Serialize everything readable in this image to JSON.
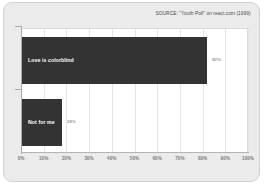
{
  "source_note": "SOURCE: \"Youth Poll\" on react.com (1999)",
  "colors": {
    "bar": "#333333",
    "plot_background": "#ffffff",
    "card_background": "#ebebeb",
    "gridline": "#e4e4e4",
    "axis": "#a9a9a9",
    "tick_label": "#7d7d7d",
    "value_label": "#5a5a5a",
    "bar_label": "#ffffff"
  },
  "chart_data": {
    "type": "bar",
    "orientation": "horizontal",
    "title": "",
    "subtitle": "",
    "xlabel": "",
    "ylabel": "",
    "categories": [
      "Love is colorblind",
      "Not for me"
    ],
    "values": [
      82,
      18
    ],
    "value_labels": [
      "82%",
      "18%"
    ],
    "xlim": [
      0,
      100
    ],
    "x_tick_labels": [
      "0%",
      "10%",
      "20%",
      "30%",
      "40%",
      "50%",
      "60%",
      "70%",
      "80%",
      "90%",
      "100%"
    ],
    "x_ticks": [
      0,
      10,
      20,
      30,
      40,
      50,
      60,
      70,
      80,
      90,
      100
    ],
    "grid": "vertical",
    "legend": "none",
    "annotations": [
      "SOURCE: \"Youth Poll\" on react.com (1999)"
    ]
  }
}
